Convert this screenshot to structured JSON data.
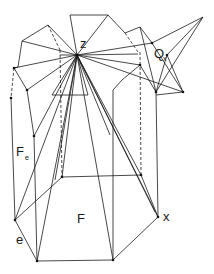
{
  "diagram": {
    "type": "polyhedral-fan-diagram",
    "labels": {
      "z": "z",
      "Q": "Q",
      "Q_sub": "x",
      "F_e": "F",
      "F_e_sub": "e",
      "F": "F",
      "x": "x",
      "e": "e"
    },
    "colors": {
      "line": "#1a1a1a",
      "background": "#ffffff"
    }
  }
}
